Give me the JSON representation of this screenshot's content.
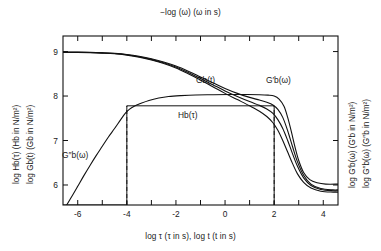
{
  "chart_data": {
    "type": "line",
    "title": "",
    "top_axis_label": "−log (ω) (ω in s)",
    "xlabel": "log τ (τ in s), log t (t in s)",
    "ylabel_left_1": "log Hb(τ) (Hb in N/m²)",
    "ylabel_left_2": "log Gb(t) (Gb in N/m²)",
    "ylabel_right_1": "log G′b(ω) (G′b in N/m²)",
    "ylabel_right_2": "log G″b(ω) (G″b in N/m²)",
    "xlim": [
      -6.6,
      4.6
    ],
    "ylim": [
      5.55,
      9.35
    ],
    "xticks": [
      -6,
      -5,
      -4,
      -3,
      -2,
      -1,
      0,
      1,
      2,
      3,
      4
    ],
    "xticklabels": [
      "-6",
      "",
      "-4",
      "",
      "-2",
      "",
      "0",
      "",
      "2",
      "",
      "4"
    ],
    "yticks": [
      6,
      7,
      8,
      9
    ],
    "yticklabels": [
      "6",
      "7",
      "8",
      "9"
    ],
    "top_axis_ticks": [
      -6,
      -5,
      -4,
      -3,
      -2,
      -1,
      0,
      1,
      2,
      3,
      4
    ],
    "grid": false,
    "legend": "inline-labels",
    "dashed_guides_x": [
      -4,
      2
    ],
    "annotations": [
      {
        "text": "Gb(t)",
        "x": -0.6,
        "y": 8.28
      },
      {
        "text": "G′b(ω)",
        "x": 1.9,
        "y": 8.28
      },
      {
        "text": "Hb(τ)",
        "x": -1.2,
        "y": 7.52
      },
      {
        "text": "G″b(ω)",
        "x": -4.85,
        "y": 6.62
      }
    ],
    "series": [
      {
        "name": "G_b(t)",
        "label": "Gb(t)",
        "points": [
          [
            -6.6,
            8.98
          ],
          [
            -6.0,
            8.98
          ],
          [
            -5.5,
            8.975
          ],
          [
            -5.0,
            8.965
          ],
          [
            -4.5,
            8.95
          ],
          [
            -4.0,
            8.92
          ],
          [
            -3.5,
            8.875
          ],
          [
            -3.0,
            8.81
          ],
          [
            -2.5,
            8.73
          ],
          [
            -2.0,
            8.63
          ],
          [
            -1.5,
            8.5
          ],
          [
            -1.0,
            8.36
          ],
          [
            -0.5,
            8.21
          ],
          [
            0.0,
            8.06
          ],
          [
            0.5,
            7.92
          ],
          [
            1.0,
            7.78
          ],
          [
            1.4,
            7.66
          ],
          [
            1.7,
            7.54
          ],
          [
            1.95,
            7.4
          ],
          [
            2.15,
            7.23
          ],
          [
            2.35,
            7.0
          ],
          [
            2.55,
            6.74
          ],
          [
            2.75,
            6.48
          ],
          [
            2.95,
            6.25
          ],
          [
            3.2,
            6.06
          ],
          [
            3.5,
            5.93
          ],
          [
            3.9,
            5.86
          ],
          [
            4.4,
            5.84
          ],
          [
            4.6,
            5.84
          ]
        ]
      },
      {
        "name": "G'_b(omega)",
        "label": "G′b(ω)",
        "points": [
          [
            -6.6,
            8.99
          ],
          [
            -6.0,
            8.99
          ],
          [
            -5.5,
            8.985
          ],
          [
            -5.0,
            8.975
          ],
          [
            -4.5,
            8.96
          ],
          [
            -4.0,
            8.935
          ],
          [
            -3.5,
            8.895
          ],
          [
            -3.0,
            8.84
          ],
          [
            -2.5,
            8.765
          ],
          [
            -2.0,
            8.675
          ],
          [
            -1.5,
            8.56
          ],
          [
            -1.0,
            8.43
          ],
          [
            -0.5,
            8.3
          ],
          [
            0.0,
            8.17
          ],
          [
            0.5,
            8.06
          ],
          [
            1.0,
            7.97
          ],
          [
            1.4,
            7.91
          ],
          [
            1.7,
            7.86
          ],
          [
            1.95,
            7.8
          ],
          [
            2.15,
            7.7
          ],
          [
            2.35,
            7.52
          ],
          [
            2.55,
            7.22
          ],
          [
            2.75,
            6.86
          ],
          [
            2.95,
            6.52
          ],
          [
            3.2,
            6.22
          ],
          [
            3.5,
            6.02
          ],
          [
            3.9,
            5.92
          ],
          [
            4.4,
            5.89
          ],
          [
            4.6,
            5.89
          ]
        ]
      },
      {
        "name": "G_b(t)_alt",
        "label": "",
        "points": [
          [
            -6.6,
            8.985
          ],
          [
            -6.0,
            8.985
          ],
          [
            -5.5,
            8.98
          ],
          [
            -5.0,
            8.97
          ],
          [
            -4.5,
            8.955
          ],
          [
            -4.0,
            8.928
          ],
          [
            -3.5,
            8.885
          ],
          [
            -3.0,
            8.825
          ],
          [
            -2.5,
            8.748
          ],
          [
            -2.0,
            8.652
          ],
          [
            -1.5,
            8.53
          ],
          [
            -1.0,
            8.395
          ],
          [
            -0.5,
            8.255
          ],
          [
            0.0,
            8.115
          ],
          [
            0.5,
            7.99
          ],
          [
            1.0,
            7.875
          ],
          [
            1.4,
            7.79
          ],
          [
            1.7,
            7.71
          ],
          [
            1.95,
            7.61
          ],
          [
            2.15,
            7.47
          ],
          [
            2.35,
            7.27
          ],
          [
            2.55,
            7.0
          ],
          [
            2.75,
            6.7
          ],
          [
            2.95,
            6.42
          ],
          [
            3.2,
            6.16
          ],
          [
            3.5,
            5.99
          ],
          [
            3.9,
            5.9
          ],
          [
            4.4,
            5.87
          ],
          [
            4.6,
            5.87
          ]
        ]
      },
      {
        "name": "G''_b(omega)",
        "label": "G″b(ω)",
        "points": [
          [
            -6.45,
            5.55
          ],
          [
            -6.2,
            5.78
          ],
          [
            -6.0,
            5.97
          ],
          [
            -5.75,
            6.21
          ],
          [
            -5.5,
            6.44
          ],
          [
            -5.25,
            6.66
          ],
          [
            -5.0,
            6.87
          ],
          [
            -4.75,
            7.08
          ],
          [
            -4.5,
            7.27
          ],
          [
            -4.25,
            7.47
          ],
          [
            -4.05,
            7.62
          ],
          [
            -3.9,
            7.7
          ],
          [
            -3.7,
            7.77
          ],
          [
            -3.45,
            7.83
          ],
          [
            -3.1,
            7.9
          ],
          [
            -2.7,
            7.955
          ],
          [
            -2.3,
            7.99
          ],
          [
            -1.8,
            8.01
          ],
          [
            -1.2,
            8.025
          ],
          [
            -0.5,
            8.03
          ],
          [
            0.2,
            8.035
          ],
          [
            0.9,
            8.035
          ],
          [
            1.4,
            8.03
          ],
          [
            1.75,
            8.02
          ],
          [
            2.0,
            8.0
          ],
          [
            2.2,
            7.93
          ],
          [
            2.4,
            7.77
          ],
          [
            2.55,
            7.52
          ],
          [
            2.7,
            7.2
          ],
          [
            2.85,
            6.85
          ],
          [
            3.0,
            6.55
          ],
          [
            3.2,
            6.28
          ],
          [
            3.45,
            6.12
          ],
          [
            3.75,
            6.05
          ],
          [
            4.1,
            6.02
          ],
          [
            4.6,
            6.02
          ]
        ]
      },
      {
        "name": "H_b(tau)",
        "label": "Hb(τ)",
        "kind": "box",
        "points": [
          [
            -6.6,
            5.55
          ],
          [
            -4.0,
            5.55
          ],
          [
            -4.0,
            7.78
          ],
          [
            2.0,
            7.78
          ],
          [
            2.0,
            5.55
          ]
        ]
      }
    ]
  }
}
